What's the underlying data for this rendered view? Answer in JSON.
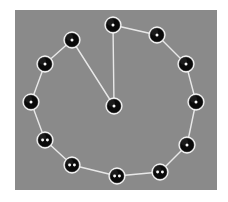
{
  "figure": {
    "background_color": "#ffffff",
    "panel_color": "#8a8a8a",
    "edge_color": "#e8e8e8",
    "node_fill_color": "#0a0a0a",
    "node_outline_color": "#f2f2f2",
    "pip_color": "#fafafa",
    "panel": {
      "x": 15,
      "y": 10,
      "width": 202,
      "height": 180
    }
  },
  "chart_data": {
    "type": "scatter",
    "xlabel": "",
    "ylabel": "",
    "grid": false,
    "legend": "none",
    "xlim": [
      0,
      202
    ],
    "ylim": [
      0,
      180
    ],
    "node_count": 13,
    "edge_count": 13,
    "node_radius": 8,
    "nodes": [
      {
        "id": "n0",
        "label": "1",
        "pips": 1,
        "x": 98,
        "y": 15,
        "ring_index": 0,
        "role": "ring"
      },
      {
        "id": "n1",
        "label": "1",
        "pips": 1,
        "x": 142,
        "y": 25,
        "ring_index": 1,
        "role": "ring"
      },
      {
        "id": "n2",
        "label": "1",
        "pips": 1,
        "x": 171,
        "y": 54,
        "ring_index": 2,
        "role": "ring"
      },
      {
        "id": "n3",
        "label": "1",
        "pips": 1,
        "x": 181,
        "y": 92,
        "ring_index": 3,
        "role": "ring"
      },
      {
        "id": "n4",
        "label": "1",
        "pips": 1,
        "x": 172,
        "y": 135,
        "ring_index": 4,
        "role": "ring"
      },
      {
        "id": "n5",
        "label": "2",
        "pips": 2,
        "x": 145,
        "y": 162,
        "ring_index": 5,
        "role": "ring"
      },
      {
        "id": "n6",
        "label": "2",
        "pips": 2,
        "x": 102,
        "y": 166,
        "ring_index": 6,
        "role": "ring"
      },
      {
        "id": "n7",
        "label": "2",
        "pips": 2,
        "x": 57,
        "y": 155,
        "ring_index": 7,
        "role": "ring"
      },
      {
        "id": "n8",
        "label": "2",
        "pips": 2,
        "x": 30,
        "y": 130,
        "ring_index": 8,
        "role": "ring"
      },
      {
        "id": "n9",
        "label": "1",
        "pips": 1,
        "x": 16,
        "y": 92,
        "ring_index": 9,
        "role": "ring"
      },
      {
        "id": "n10",
        "label": "1",
        "pips": 1,
        "x": 30,
        "y": 54,
        "ring_index": 10,
        "role": "ring"
      },
      {
        "id": "n11",
        "label": "1",
        "pips": 1,
        "x": 57,
        "y": 30,
        "ring_index": 11,
        "role": "ring"
      },
      {
        "id": "n12",
        "label": "1",
        "pips": 1,
        "x": 99,
        "y": 96,
        "ring_index": null,
        "role": "center"
      }
    ],
    "edges": [
      {
        "source": "n0",
        "target": "n1"
      },
      {
        "source": "n1",
        "target": "n2"
      },
      {
        "source": "n2",
        "target": "n3"
      },
      {
        "source": "n3",
        "target": "n4"
      },
      {
        "source": "n4",
        "target": "n5"
      },
      {
        "source": "n5",
        "target": "n6"
      },
      {
        "source": "n6",
        "target": "n7"
      },
      {
        "source": "n7",
        "target": "n8"
      },
      {
        "source": "n8",
        "target": "n9"
      },
      {
        "source": "n9",
        "target": "n10"
      },
      {
        "source": "n10",
        "target": "n11"
      },
      {
        "source": "n12",
        "target": "n0"
      },
      {
        "source": "n12",
        "target": "n11"
      }
    ]
  }
}
